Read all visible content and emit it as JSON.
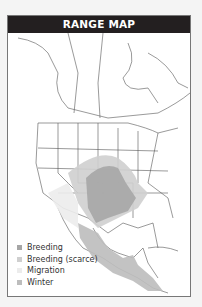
{
  "header": {
    "title": "RANGE MAP"
  },
  "legend": {
    "items": [
      {
        "label": "Breeding",
        "color": "#a6a6a6"
      },
      {
        "label": "Breeding (scarce)",
        "color": "#cfcfcf"
      },
      {
        "label": "Migration",
        "color": "#ececec"
      },
      {
        "label": "Winter",
        "color": "#bdbdbd"
      }
    ]
  },
  "map": {
    "region": "North and Central America"
  }
}
